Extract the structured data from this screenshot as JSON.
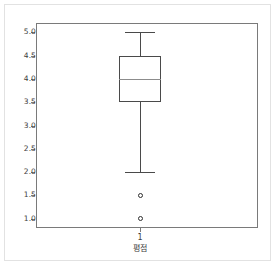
{
  "chart_data": {
    "type": "box",
    "title": "",
    "xlabel": "평점",
    "ylabel": "",
    "grid": false,
    "legend": null,
    "ylim": [
      0.8,
      5.2
    ],
    "yticks": [
      "5.0",
      "4.5",
      "4.0",
      "3.5",
      "3.0",
      "2.5",
      "2.0",
      "1.5",
      "1.0"
    ],
    "ytick_values": [
      5.0,
      4.5,
      4.0,
      3.5,
      3.0,
      2.5,
      2.0,
      1.5,
      1.0
    ],
    "xticks": [
      "1"
    ],
    "boxes": [
      {
        "label": "1",
        "whisker_low": 2.0,
        "q1": 3.5,
        "median": 4.0,
        "q3": 4.5,
        "whisker_high": 5.0,
        "outliers": [
          1.5,
          1.0
        ]
      }
    ]
  },
  "style": {
    "box_edge_color": "#4a4a4a",
    "median_color": "#8c8c8c",
    "axis_color": "#7a7a7a",
    "tick_text_color": "#3c3c3c",
    "outlier_edge_color": "#2e2e2e",
    "card_border_color": "#e2e2e2",
    "background": "#ffffff"
  }
}
